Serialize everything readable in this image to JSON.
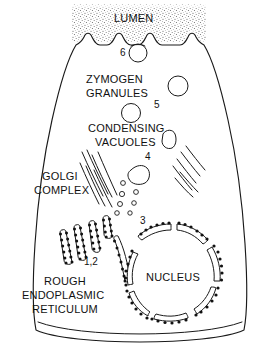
{
  "figure": {
    "type": "biological-cell-diagram",
    "background_color": "#ffffff",
    "line_color": "#1a1a1a",
    "stipple_color": "#666666"
  },
  "labels": {
    "lumen": "LUMEN",
    "zymogen_granules_line1": "ZYMOGEN",
    "zymogen_granules_line2": "GRANULES",
    "condensing_vacuoles_line1": "CONDENSING",
    "condensing_vacuoles_line2": "VACUOLES",
    "golgi_line1": "GOLGI",
    "golgi_line2": "COMPLEX",
    "rough_er_line1": "ROUGH",
    "rough_er_line2": "ENDOPLASMIC",
    "rough_er_line3": "RETICULUM",
    "nucleus": "NUCLEUS"
  },
  "step_numbers": {
    "n12": "1,2",
    "n3": "3",
    "n4": "4",
    "n5": "5",
    "n6": "6"
  },
  "structures": {
    "lumen_region": "stippled apical lumen with microvilli",
    "exocytosis_vesicle": "apical secretory granule fusing at 6",
    "zymogen_granule_count": 3,
    "condensing_vacuole_count": 2,
    "golgi_cisterna_count": 7,
    "rough_er_tubule_count": 6,
    "nuclear_envelope_arc_count": 6,
    "transport_vesicle_count": 6
  }
}
